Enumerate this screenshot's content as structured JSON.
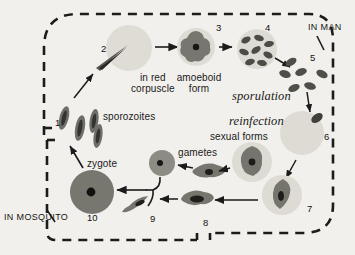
{
  "figure": {
    "background_color": "#f2f0ec",
    "ink_color": "#1a1a1a",
    "regions": [
      {
        "id": "in-man",
        "label": "IN MAN"
      },
      {
        "id": "in-mosquito",
        "label": "IN MOSQUITO"
      }
    ],
    "text_labels": [
      {
        "id": "in-red-corpuscle",
        "line1": "in red",
        "line2": "corpuscle"
      },
      {
        "id": "amoeboid-form",
        "line1": "amoeboid",
        "line2": "form"
      },
      {
        "id": "sporozoites",
        "text": "sporozoites"
      },
      {
        "id": "sporulation",
        "text": "sporulation",
        "style": "serif-italic"
      },
      {
        "id": "reinfection",
        "text": "reinfection",
        "style": "serif-italic"
      },
      {
        "id": "sexual-forms",
        "text": "sexual forms"
      },
      {
        "id": "gametes",
        "text": "gametes"
      },
      {
        "id": "zygote",
        "text": "zygote"
      }
    ],
    "stage_numbers": [
      "1",
      "2",
      "3",
      "4",
      "5",
      "6",
      "7",
      "8",
      "9",
      "10"
    ],
    "stages": [
      {
        "number": "1",
        "name": "sporozoites",
        "compartment": "mosquito"
      },
      {
        "number": "2",
        "name": "sporozoite entering red corpuscle",
        "compartment": "man"
      },
      {
        "number": "3",
        "name": "amoeboid form",
        "compartment": "man"
      },
      {
        "number": "4",
        "name": "segmented schizont",
        "compartment": "man"
      },
      {
        "number": "5",
        "name": "merozoites / sporulation",
        "compartment": "man"
      },
      {
        "number": "6",
        "name": "reinfection of red corpuscle",
        "compartment": "man"
      },
      {
        "number": "7",
        "name": "sexual form in corpuscle",
        "compartment": "man"
      },
      {
        "number": "8",
        "name": "gamete",
        "compartment": "mosquito"
      },
      {
        "number": "9",
        "name": "gamete",
        "compartment": "mosquito"
      },
      {
        "number": "10",
        "name": "zygote",
        "compartment": "mosquito"
      }
    ],
    "colors": {
      "cell_pale": "#dedcd6",
      "cell_mid": "#9e9e98",
      "parasite_dark": "#6e6e68",
      "nucleus": "#1e1e1e",
      "border": "#1c1c1c"
    }
  }
}
